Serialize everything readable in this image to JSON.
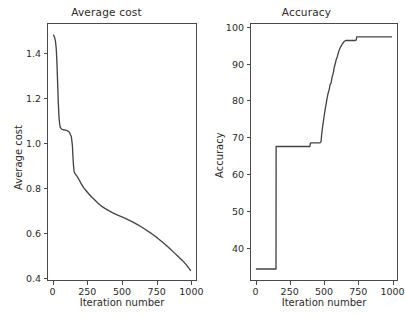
{
  "figure": {
    "width": 405,
    "height": 331,
    "background": "#ffffff",
    "line_color": "#444444",
    "axis_color": "#4a4a4a",
    "text_color": "#2b2b2b"
  },
  "caption": {
    "text": "",
    "note": "truncated-at-image-edge"
  },
  "chart_data": [
    {
      "type": "line",
      "title": "Average cost",
      "xlabel": "Iteration number",
      "ylabel": "Average cost",
      "xlim": [
        -40,
        1040
      ],
      "ylim": [
        0.3,
        1.45
      ],
      "xticks": [
        0,
        250,
        500,
        750,
        1000
      ],
      "yticks": [
        0.4,
        0.6,
        0.8,
        1.0,
        1.2,
        1.4
      ],
      "ytick_labels": [
        "0.4",
        "0.6",
        "0.8",
        "1.0",
        "1.2",
        "1.4"
      ],
      "xtick_labels": [
        "0",
        "250",
        "500",
        "750",
        "1000"
      ],
      "grid": false,
      "legend": null,
      "series": [
        {
          "name": "average cost",
          "x": [
            0,
            5,
            10,
            15,
            20,
            25,
            30,
            35,
            40,
            45,
            50,
            60,
            70,
            85,
            100,
            115,
            130,
            138,
            142,
            146,
            150,
            155,
            160,
            170,
            180,
            200,
            220,
            240,
            260,
            280,
            300,
            325,
            350,
            375,
            400,
            430,
            460,
            490,
            520,
            550,
            580,
            610,
            640,
            670,
            700,
            730,
            760,
            790,
            820,
            850,
            880,
            910,
            940,
            970,
            1000
          ],
          "y": [
            1.4,
            1.395,
            1.385,
            1.37,
            1.34,
            1.28,
            1.19,
            1.1,
            1.035,
            1.0,
            0.985,
            0.978,
            0.975,
            0.973,
            0.971,
            0.965,
            0.945,
            0.905,
            0.855,
            0.815,
            0.79,
            0.78,
            0.775,
            0.768,
            0.758,
            0.735,
            0.715,
            0.7,
            0.685,
            0.672,
            0.66,
            0.645,
            0.632,
            0.622,
            0.613,
            0.603,
            0.594,
            0.586,
            0.578,
            0.569,
            0.56,
            0.55,
            0.539,
            0.527,
            0.515,
            0.502,
            0.488,
            0.473,
            0.457,
            0.44,
            0.423,
            0.406,
            0.388,
            0.368,
            0.343
          ]
        }
      ]
    },
    {
      "type": "line",
      "title": "Accuracy",
      "xlabel": "Iteration number",
      "ylabel": "Accuracy",
      "xlim": [
        -40,
        1040
      ],
      "ylim": [
        31,
        101
      ],
      "xticks": [
        0,
        250,
        500,
        750,
        1000
      ],
      "yticks": [
        40,
        50,
        60,
        70,
        80,
        90,
        100
      ],
      "ytick_labels": [
        "40",
        "50",
        "60",
        "70",
        "80",
        "90",
        "100"
      ],
      "xtick_labels": [
        "0",
        "250",
        "500",
        "750",
        "1000"
      ],
      "grid": false,
      "legend": null,
      "series": [
        {
          "name": "accuracy",
          "x": [
            0,
            140,
            145,
            146,
            150,
            200,
            250,
            300,
            350,
            395,
            400,
            440,
            470,
            478,
            482,
            490,
            500,
            508,
            515,
            522,
            530,
            538,
            545,
            552,
            560,
            568,
            575,
            582,
            590,
            598,
            605,
            612,
            620,
            628,
            636,
            644,
            652,
            660,
            670,
            690,
            710,
            730,
            738,
            742,
            800,
            860,
            920,
            1000
          ],
          "y": [
            34.0,
            34.0,
            34.0,
            67.5,
            67.5,
            67.5,
            67.5,
            67.5,
            67.5,
            67.5,
            68.5,
            68.5,
            68.5,
            68.8,
            70.5,
            73.0,
            75.5,
            77.5,
            79.0,
            80.5,
            82.0,
            83.0,
            84.5,
            84.8,
            86.5,
            87.5,
            89.0,
            90.0,
            91.2,
            92.0,
            93.0,
            93.8,
            94.5,
            95.0,
            95.6,
            96.0,
            96.3,
            96.5,
            96.5,
            96.5,
            96.5,
            96.5,
            96.6,
            97.5,
            97.5,
            97.5,
            97.5,
            97.5
          ]
        }
      ]
    }
  ]
}
